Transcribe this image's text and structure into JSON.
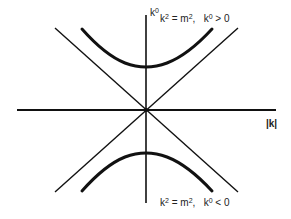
{
  "diagram": {
    "type": "mass-shell hyperboloid / light cone in momentum space",
    "axes": {
      "vertical": {
        "label_base": "k",
        "label_sup": "0"
      },
      "horizontal": {
        "label": "|k|"
      }
    },
    "branches": {
      "upper": {
        "lhs_base": "k",
        "lhs_sup": "2",
        "eq": " = m",
        "eq_sup": "2",
        "sep": ",   ",
        "cond_base": "k",
        "cond_sup": "0",
        "cond_rel": " > 0"
      },
      "lower": {
        "lhs_base": "k",
        "lhs_sup": "2",
        "eq": " = m",
        "eq_sup": "2",
        "sep": ",   ",
        "cond_base": "k",
        "cond_sup": "0",
        "cond_rel": " < 0"
      }
    },
    "colors": {
      "line": "#111111",
      "background": "#ffffff"
    }
  }
}
